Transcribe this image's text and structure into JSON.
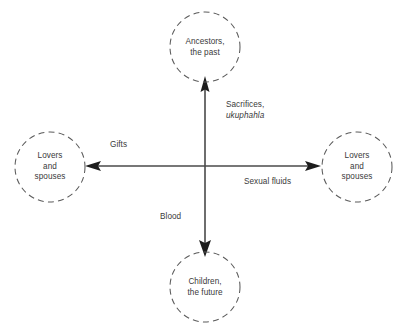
{
  "diagram": {
    "background_color": "#ffffff",
    "line_color": "#3c3c3c",
    "circle_stroke_color": "#555555",
    "text_color": "#3a3a3a",
    "nodes": [
      {
        "id": "ancestors",
        "position": "top",
        "label": "Ancestors,\nthe past",
        "shape": "dashed-circle",
        "cx": 205,
        "cy": 47,
        "r": 35
      },
      {
        "id": "lovers-left",
        "position": "left",
        "label": "Lovers\nand\nspouses",
        "shape": "dashed-circle",
        "cx": 50,
        "cy": 167,
        "r": 35
      },
      {
        "id": "lovers-right",
        "position": "right",
        "label": "Lovers\nand\nspouses",
        "shape": "dashed-circle",
        "cx": 357,
        "cy": 167,
        "r": 35
      },
      {
        "id": "children",
        "position": "bottom",
        "label": "Children,\nthe future",
        "shape": "dashed-circle",
        "cx": 205,
        "cy": 287,
        "r": 35
      }
    ],
    "edges": [
      {
        "id": "edge-up",
        "direction": "up",
        "from": "center",
        "to": "ancestors",
        "label_line1": "Sacrifices,",
        "label_line2": "ukuphahla",
        "label_line2_style": "italic"
      },
      {
        "id": "edge-left",
        "direction": "left",
        "from": "center",
        "to": "lovers-left",
        "label_line1": "Gifts",
        "label_line2": "",
        "label_line2_style": "normal"
      },
      {
        "id": "edge-right",
        "direction": "right",
        "from": "center",
        "to": "lovers-right",
        "label_line1": "Sexual fluids",
        "label_line2": "",
        "label_line2_style": "normal"
      },
      {
        "id": "edge-down",
        "direction": "down",
        "from": "center",
        "to": "children",
        "label_line1": "Blood",
        "label_line2": "",
        "label_line2_style": "normal"
      }
    ]
  }
}
